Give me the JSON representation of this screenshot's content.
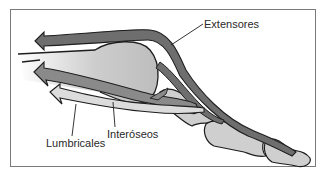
{
  "diagram": {
    "labels": {
      "extensores": "Extensores",
      "interoseos": "Interóseos",
      "lumbricales": "Lumbricales"
    },
    "colors": {
      "extensor_tendon": "#6e6e6e",
      "interosseous_tendon": "#8a8a8a",
      "lumbrical_tendon": "#d4d4d4",
      "bone_fill": "#cfcfcf",
      "outline": "#1e1e1e",
      "frame": "#7a7a7a"
    }
  }
}
